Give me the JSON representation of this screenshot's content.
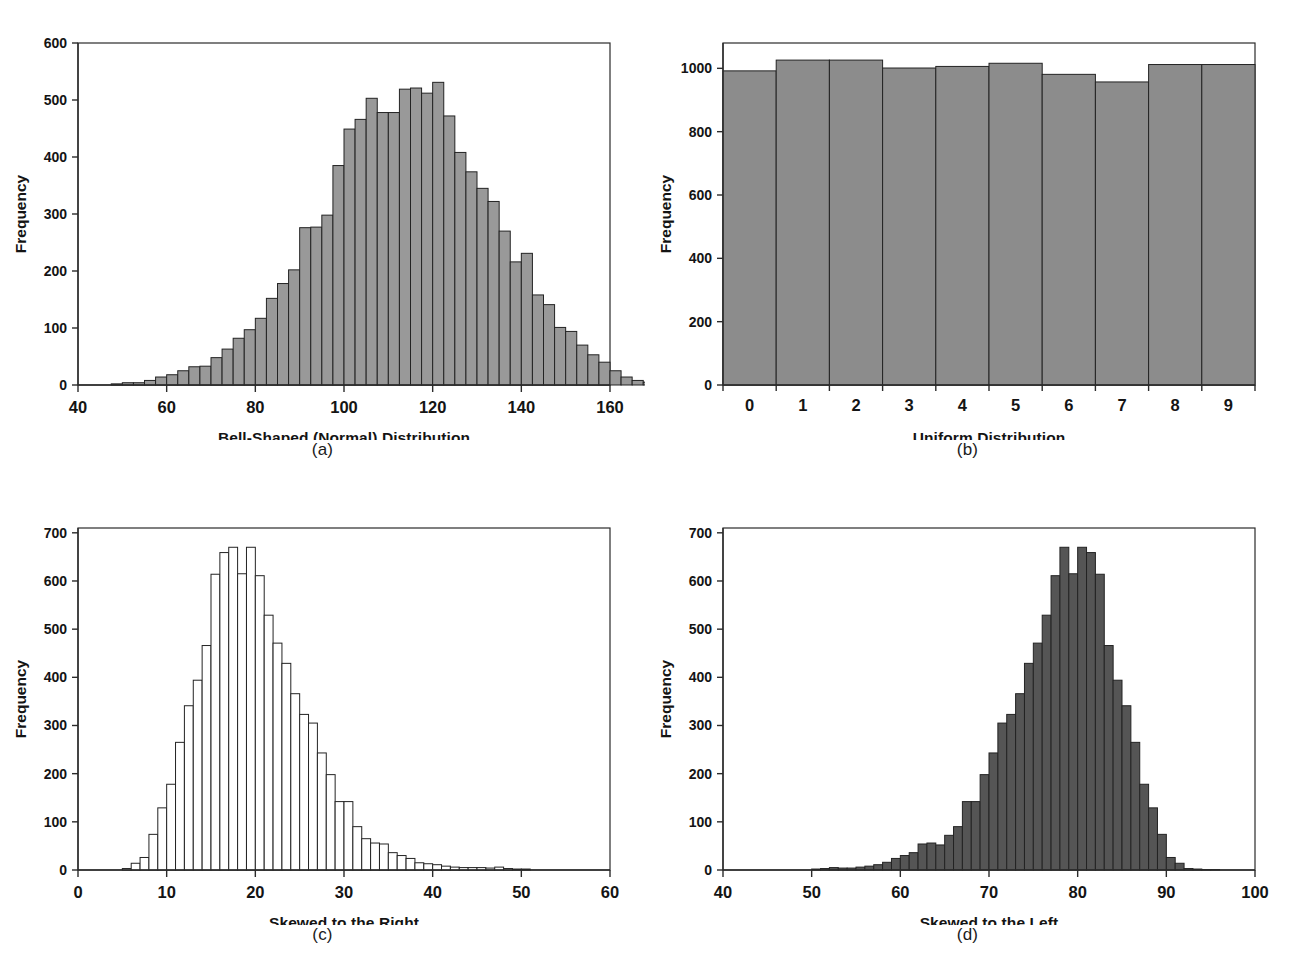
{
  "figure": {
    "panels": [
      {
        "id": "a",
        "caption": "(a)",
        "ylabel": "Frequency",
        "chart_data": {
          "type": "bar",
          "title": "",
          "xlabel": "Bell-Shaped (Normal) Distribution",
          "ylabel": "Frequency",
          "xlim": [
            40,
            160
          ],
          "ylim": [
            0,
            600
          ],
          "xticks": [
            40,
            60,
            80,
            100,
            120,
            140,
            160
          ],
          "yticks": [
            0,
            100,
            200,
            300,
            400,
            500,
            600
          ],
          "grid": false,
          "legend": "none",
          "bar_fill": "#999999",
          "bar_edge": "#232323",
          "bin_width": 2.5,
          "bin_starts": [
            47.5,
            50.0,
            52.5,
            55.0,
            57.5,
            60.0,
            62.5,
            65.0,
            67.5,
            70.0,
            72.5,
            75.0,
            77.5,
            80.0,
            82.5,
            85.0,
            87.5,
            90.0,
            92.5,
            95.0,
            97.5,
            100.0,
            102.5,
            105.0,
            107.5,
            110.0,
            112.5,
            115.0,
            117.5,
            120.0,
            122.5,
            125.0,
            127.5,
            130.0,
            132.5,
            135.0,
            137.5,
            140.0,
            142.5,
            145.0,
            147.5,
            150.0
          ],
          "values": [
            2,
            4,
            4,
            8,
            14,
            18,
            25,
            32,
            33,
            48,
            63,
            82,
            97,
            117,
            152,
            178,
            202,
            276,
            277,
            298,
            385,
            449,
            466,
            503,
            478,
            478,
            519,
            521,
            512,
            531,
            472,
            408,
            374,
            345,
            322,
            270,
            216,
            231,
            158,
            141,
            101,
            94
          ],
          "tail_values": [
            70,
            53,
            40,
            25,
            14,
            8,
            5,
            3,
            3,
            2
          ]
        }
      },
      {
        "id": "b",
        "caption": "(b)",
        "ylabel": "Frequency",
        "chart_data": {
          "type": "bar",
          "title": "",
          "xlabel": "Uniform Distribution",
          "ylabel": "Frequency",
          "xlim": [
            -0.5,
            9.5
          ],
          "ylim": [
            0,
            1080
          ],
          "xticks": [
            0,
            1,
            2,
            3,
            4,
            5,
            6,
            7,
            8,
            9
          ],
          "yticks": [
            0,
            200,
            400,
            600,
            800,
            1000
          ],
          "grid": false,
          "legend": "none",
          "bar_fill": "#8c8c8c",
          "bar_edge": "#232323",
          "categories": [
            "0",
            "1",
            "2",
            "3",
            "4",
            "5",
            "6",
            "7",
            "8",
            "9"
          ],
          "values": [
            992,
            1026,
            1026,
            1001,
            1006,
            1016,
            981,
            957,
            1012,
            1012
          ]
        }
      },
      {
        "id": "c",
        "caption": "(c)",
        "ylabel": "Frequency",
        "chart_data": {
          "type": "bar",
          "title": "",
          "xlabel": "Skewed to the Right",
          "ylabel": "Frequency",
          "xlim": [
            0,
            60
          ],
          "ylim": [
            0,
            710
          ],
          "xticks": [
            0,
            10,
            20,
            30,
            40,
            50,
            60
          ],
          "yticks": [
            0,
            100,
            200,
            300,
            400,
            500,
            600,
            700
          ],
          "grid": false,
          "legend": "none",
          "bar_fill": "#ffffff",
          "bar_edge": "#232323",
          "bin_width": 1.0,
          "bin_starts": [
            5,
            6,
            7,
            8,
            9,
            10,
            11,
            12,
            13,
            14,
            15,
            16,
            17,
            18,
            19,
            20,
            21,
            22,
            23,
            24,
            25,
            26,
            27,
            28,
            29,
            30,
            31,
            32,
            33,
            34,
            35,
            36,
            37,
            38,
            39,
            40,
            41,
            42,
            43,
            44,
            45,
            46,
            47,
            48,
            49,
            50
          ],
          "values": [
            3,
            14,
            26,
            74,
            129,
            178,
            265,
            341,
            394,
            466,
            614,
            659,
            670,
            615,
            670,
            611,
            529,
            471,
            429,
            366,
            323,
            305,
            243,
            198,
            142,
            142,
            90,
            65,
            56,
            54,
            36,
            30,
            24,
            15,
            13,
            11,
            8,
            6,
            5,
            5,
            5,
            4,
            6,
            3,
            2,
            2
          ]
        }
      },
      {
        "id": "d",
        "caption": "(d)",
        "ylabel": "Frequency",
        "chart_data": {
          "type": "bar",
          "title": "",
          "xlabel": "Skewed to the Left",
          "ylabel": "Frequency",
          "xlim": [
            40,
            100
          ],
          "ylim": [
            0,
            710
          ],
          "xticks": [
            40,
            50,
            60,
            70,
            80,
            90,
            100
          ],
          "yticks": [
            0,
            100,
            200,
            300,
            400,
            500,
            600,
            700
          ],
          "grid": false,
          "legend": "none",
          "bar_fill": "#555555",
          "bar_edge": "#1a1a1a",
          "bin_width": 1.0,
          "bin_starts": [
            50,
            51,
            52,
            53,
            54,
            55,
            56,
            57,
            58,
            59,
            60,
            61,
            62,
            63,
            64,
            65,
            66,
            67,
            68,
            69,
            70,
            71,
            72,
            73,
            74,
            75,
            76,
            77,
            78,
            79,
            80,
            81,
            82,
            83,
            84,
            85,
            86,
            87,
            88,
            89,
            90,
            91,
            92,
            93,
            94,
            95
          ],
          "values": [
            2,
            3,
            5,
            4,
            4,
            6,
            8,
            11,
            16,
            24,
            30,
            36,
            54,
            56,
            52,
            72,
            90,
            142,
            142,
            198,
            243,
            305,
            323,
            366,
            429,
            471,
            529,
            611,
            670,
            615,
            670,
            659,
            614,
            466,
            394,
            341,
            265,
            178,
            129,
            74,
            26,
            14,
            3,
            2,
            1,
            1
          ]
        }
      }
    ]
  }
}
